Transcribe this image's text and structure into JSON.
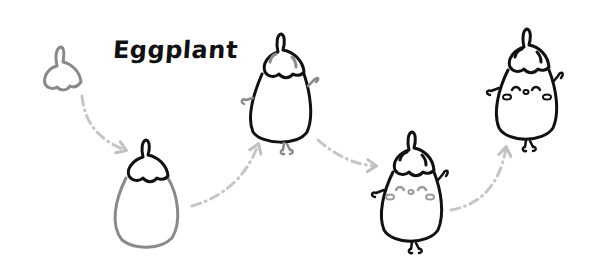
{
  "title": "Eggplant",
  "colors": {
    "ink": "#111111",
    "light_ink": "#808080",
    "arrow": "#c0c0c0",
    "background": "#ffffff"
  },
  "steps": [
    {
      "step": 1,
      "name": "cap-outline",
      "description": "Draw cap with stem (light gray)"
    },
    {
      "step": 2,
      "name": "body-outline",
      "description": "Cap in black, body outline in gray"
    },
    {
      "step": 3,
      "name": "body-inked",
      "description": "Body inked, arms and feet sketched in gray"
    },
    {
      "step": 4,
      "name": "face-added",
      "description": "Arms and feet inked, face added in gray"
    },
    {
      "step": 5,
      "name": "final",
      "description": "Completed eggplant character"
    }
  ],
  "arrows": [
    {
      "from": 1,
      "to": 2,
      "style": "dash-dot"
    },
    {
      "from": 2,
      "to": 3,
      "style": "dash-dot"
    },
    {
      "from": 3,
      "to": 4,
      "style": "dash-dot"
    },
    {
      "from": 4,
      "to": 5,
      "style": "dash-dot"
    }
  ]
}
